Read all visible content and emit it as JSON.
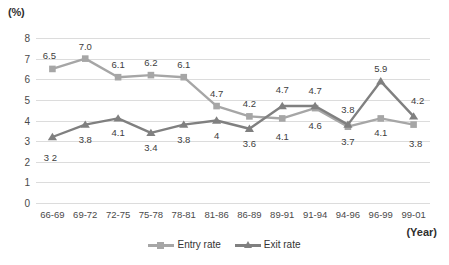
{
  "chart_data": {
    "type": "line",
    "title": "",
    "subtitle": "",
    "xlabel": "(Year)",
    "ylabel": "(%)",
    "ylim": [
      0,
      8
    ],
    "y_ticks": [
      8,
      7,
      6,
      5,
      4,
      3,
      2,
      1,
      0
    ],
    "grid": true,
    "legend_position": "bottom-center",
    "categories": [
      "66-69",
      "69-72",
      "72-75",
      "75-78",
      "78-81",
      "81-86",
      "86-89",
      "89-91",
      "91-94",
      "94-96",
      "96-99",
      "99-01"
    ],
    "series": [
      {
        "name": "Entry rate",
        "marker": "square",
        "color": "#a6a6a6",
        "values": [
          6.5,
          7.0,
          6.1,
          6.2,
          6.1,
          4.7,
          4.2,
          4.1,
          4.6,
          3.7,
          4.1,
          3.8
        ],
        "labels": [
          "6.5",
          "7.0",
          "6.1",
          "6.2",
          "6.1",
          "4.7",
          "4.2",
          "4.1",
          "4.6",
          "3.7",
          "4.1",
          "3.8"
        ],
        "label_positions": [
          "above",
          "above",
          "above",
          "above",
          "above",
          "above",
          "above",
          "below",
          "below",
          "below",
          "below",
          "below"
        ]
      },
      {
        "name": "Exit rate",
        "marker": "triangle",
        "color": "#808080",
        "values": [
          3.2,
          3.8,
          4.1,
          3.4,
          3.8,
          4.0,
          3.6,
          4.7,
          4.7,
          3.8,
          5.9,
          4.2
        ],
        "labels": [
          "3 2",
          "3.8",
          "4.1",
          "3.4",
          "3.8",
          "4",
          "3.6",
          "4.7",
          "4.7",
          "3.8",
          "5.9",
          "4.2"
        ],
        "label_positions": [
          "below",
          "below",
          "below",
          "below",
          "below",
          "below",
          "below",
          "above",
          "above",
          "above",
          "above",
          "above"
        ]
      }
    ]
  },
  "legend": {
    "entry": "Entry rate",
    "exit": "Exit rate"
  },
  "axis": {
    "y_title": "(%)",
    "x_title": "(Year)"
  },
  "colors": {
    "entry": "#a6a6a6",
    "exit": "#808080",
    "grid": "#dcdcdc",
    "text": "#3d3d3d"
  }
}
